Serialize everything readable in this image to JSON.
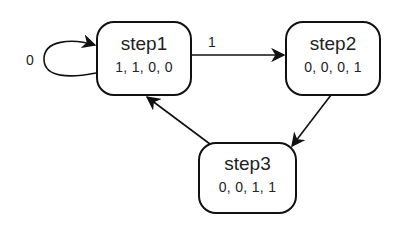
{
  "diagram": {
    "type": "state-machine",
    "nodes": [
      {
        "id": "step1",
        "name": "step1",
        "values": "1, 1, 0, 0"
      },
      {
        "id": "step2",
        "name": "step2",
        "values": "0, 0, 0, 1"
      },
      {
        "id": "step3",
        "name": "step3",
        "values": "0, 0, 1, 1"
      }
    ],
    "edges": [
      {
        "from": "step1",
        "to": "step1",
        "label": "0"
      },
      {
        "from": "step1",
        "to": "step2",
        "label": "1"
      },
      {
        "from": "step2",
        "to": "step3",
        "label": ""
      },
      {
        "from": "step3",
        "to": "step1",
        "label": ""
      }
    ],
    "colors": {
      "stroke": "#111111",
      "background": "#ffffff"
    }
  }
}
